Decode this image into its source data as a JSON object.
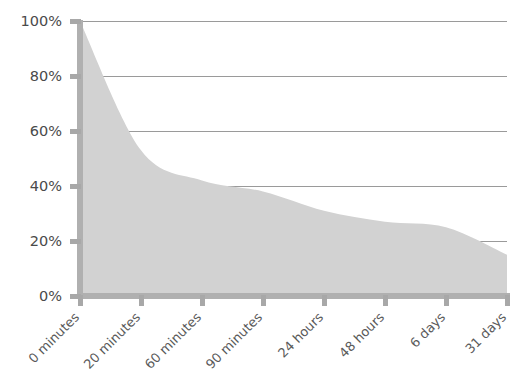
{
  "chart_data": {
    "type": "area",
    "title": "",
    "subtitle": "",
    "xlabel": "",
    "ylabel": "",
    "categories": [
      "0 minutes",
      "20 minutes",
      "60 minutes",
      "90 minutes",
      "24 hours",
      "48 hours",
      "6 days",
      "31 days"
    ],
    "values": [
      100,
      53,
      42,
      38,
      31,
      27,
      25,
      15
    ],
    "series": [
      {
        "name": "Retention",
        "values": [
          100,
          53,
          42,
          38,
          31,
          27,
          25,
          15
        ]
      }
    ],
    "points": [
      {
        "x": "0 minutes",
        "x_index": 0,
        "y": 100
      },
      {
        "x": "20 minutes",
        "x_index": 1,
        "y": 53
      },
      {
        "x": "60 minutes",
        "x_index": 2,
        "y": 42
      },
      {
        "x": "90 minutes",
        "x_index": 3,
        "y": 38
      },
      {
        "x": "24 hours",
        "x_index": 4,
        "y": 31
      },
      {
        "x": "48 hours",
        "x_index": 5,
        "y": 27
      },
      {
        "x": "6 days",
        "x_index": 6,
        "y": 25
      },
      {
        "x": "31 days",
        "x_index": 7,
        "y": 15
      }
    ],
    "ylim": [
      0,
      100
    ],
    "yticks": [
      0,
      20,
      40,
      60,
      80,
      100
    ],
    "ytick_labels": [
      "0%",
      "20%",
      "40%",
      "60%",
      "80%",
      "100%"
    ],
    "xticks": [
      0,
      1,
      2,
      3,
      4,
      5,
      6,
      7
    ],
    "xtick_labels": [
      "0 minutes",
      "20 minutes",
      "60 minutes",
      "90 minutes",
      "24 hours",
      "48 hours",
      "6 days",
      "31 days"
    ],
    "xtick_label_rotation": -45,
    "grid": true,
    "grid_axis": "y",
    "legend": false,
    "legend_position": "none",
    "colors": {
      "area_fill": "#d2d2d2",
      "gridline": "#9a9a9a",
      "axis": "#b0b0b0",
      "tick_mark": "#a8a8a8",
      "ytick_text": "#4a4a4a",
      "xtick_text": "#5a5a5a",
      "background": "#ffffff"
    }
  },
  "layout": {
    "width": 531,
    "height": 387,
    "plot_left": 80,
    "plot_right": 507,
    "plot_top": 21,
    "plot_bottom": 296
  }
}
